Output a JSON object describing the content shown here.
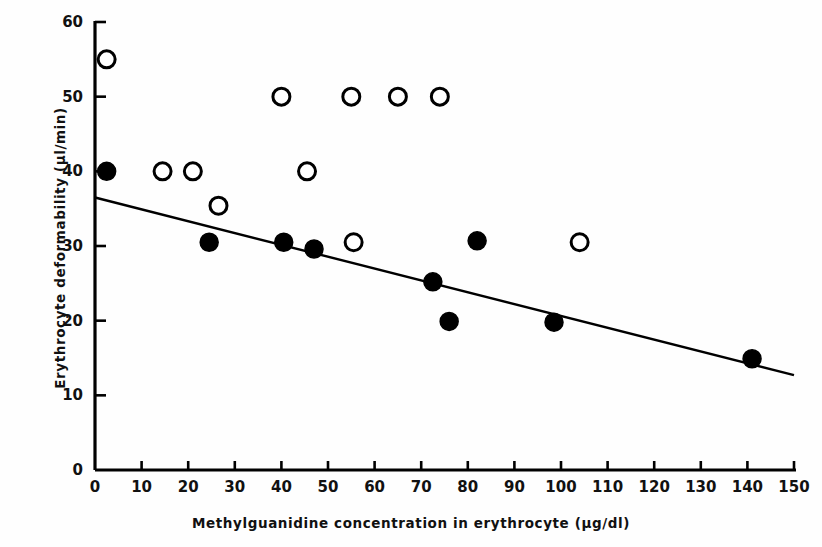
{
  "chart_data": {
    "type": "scatter",
    "title": "",
    "xlabel": "Methylguanidine concentration in erythrocyte (μg/dl)",
    "ylabel": "Erythrocyte deformability (μl/min)",
    "xlim": [
      0,
      150
    ],
    "ylim": [
      0,
      60
    ],
    "xticks": [
      0,
      10,
      20,
      30,
      40,
      50,
      60,
      70,
      80,
      90,
      100,
      110,
      120,
      130,
      140,
      150
    ],
    "yticks": [
      0,
      10,
      20,
      30,
      40,
      50,
      60
    ],
    "grid": false,
    "legend": "none",
    "series": [
      {
        "name": "open-circles",
        "marker": "open-circle",
        "color": "#000000",
        "points": [
          {
            "x": 2.5,
            "y": 55.0
          },
          {
            "x": 14.5,
            "y": 40.0
          },
          {
            "x": 21.0,
            "y": 40.0
          },
          {
            "x": 26.5,
            "y": 35.4
          },
          {
            "x": 40.0,
            "y": 50.0
          },
          {
            "x": 45.5,
            "y": 40.0
          },
          {
            "x": 55.0,
            "y": 50.0
          },
          {
            "x": 55.5,
            "y": 30.5
          },
          {
            "x": 65.0,
            "y": 50.0
          },
          {
            "x": 74.0,
            "y": 50.0
          },
          {
            "x": 104.0,
            "y": 30.5
          }
        ]
      },
      {
        "name": "filled-circles",
        "marker": "filled-circle",
        "color": "#000000",
        "points": [
          {
            "x": 2.5,
            "y": 40.0
          },
          {
            "x": 24.5,
            "y": 30.5
          },
          {
            "x": 40.5,
            "y": 30.5
          },
          {
            "x": 47.0,
            "y": 29.6
          },
          {
            "x": 72.5,
            "y": 25.2
          },
          {
            "x": 76.0,
            "y": 19.9
          },
          {
            "x": 82.0,
            "y": 30.7
          },
          {
            "x": 98.5,
            "y": 19.8
          },
          {
            "x": 141.0,
            "y": 14.9
          }
        ]
      }
    ],
    "trend_line": {
      "name": "regression-line",
      "x0": 0,
      "y0": 36.5,
      "x1": 150,
      "y1": 12.7
    }
  },
  "axes": {
    "x_tick_labels": [
      "0",
      "10",
      "20",
      "30",
      "40",
      "50",
      "60",
      "70",
      "80",
      "90",
      "100",
      "110",
      "120",
      "130",
      "140",
      "150"
    ],
    "y_tick_labels": [
      "0",
      "10",
      "20",
      "30",
      "40",
      "50",
      "60"
    ]
  }
}
